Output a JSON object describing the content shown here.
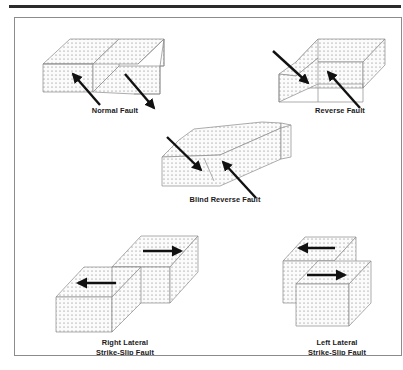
{
  "figure": {
    "frame_border_color": "#8c8c8c",
    "rule_color": "#2b2b2b",
    "block_fill": "#f2f2f2",
    "block_stroke": "#8a8a8a",
    "stipple_color": "#707070",
    "arrow_color": "#111111",
    "background": "#ffffff"
  },
  "panels": [
    {
      "id": "normal-fault",
      "label": "Normal Fault",
      "label_x": 100,
      "label_y": 88,
      "arrows": [
        {
          "name": "hanging-wall-down-left-arrow",
          "direction": "up-left"
        },
        {
          "name": "footwall-down-right-arrow",
          "direction": "down-right"
        }
      ]
    },
    {
      "id": "reverse-fault",
      "label": "Reverse Fault",
      "label_x": 325,
      "label_y": 88,
      "arrows": [
        {
          "name": "hanging-wall-up-arrow",
          "direction": "down-right"
        },
        {
          "name": "footwall-up-arrow",
          "direction": "up-left"
        }
      ]
    },
    {
      "id": "blind-reverse-fault",
      "label": "Blind Reverse Fault",
      "label_x": 210,
      "label_y": 177,
      "arrows": [
        {
          "name": "blind-hanging-wall-arrow",
          "direction": "down-right"
        },
        {
          "name": "blind-footwall-arrow",
          "direction": "up-left"
        }
      ]
    },
    {
      "id": "right-lateral-strike-slip-fault",
      "label": "Right Lateral\nStrike-Slip Fault",
      "label_x": 110,
      "label_y": 327,
      "arrows": [
        {
          "name": "far-block-right-arrow",
          "direction": "right"
        },
        {
          "name": "near-block-left-arrow",
          "direction": "left"
        }
      ]
    },
    {
      "id": "left-lateral-strike-slip-fault",
      "label": "Left Lateral\nStrike-Slip Fault",
      "label_x": 322,
      "label_y": 327,
      "arrows": [
        {
          "name": "far-block-left-arrow",
          "direction": "left"
        },
        {
          "name": "near-block-right-arrow",
          "direction": "right"
        }
      ]
    }
  ]
}
